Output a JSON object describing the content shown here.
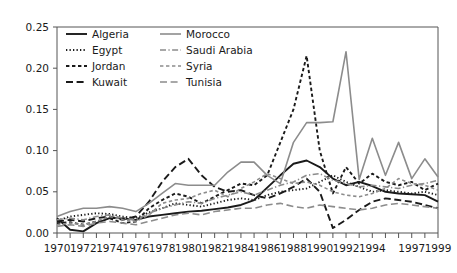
{
  "chart_data": {
    "type": "line",
    "title": "",
    "subtitle": "",
    "xlabel": "",
    "ylabel": "",
    "grid": false,
    "legend_position": "top-left-inside",
    "xlim": [
      1970,
      1999
    ],
    "ylim": [
      0.0,
      0.25
    ],
    "ytick_labels": [
      "0.00",
      "0.05",
      "0.10",
      "0.15",
      "0.20",
      "0.25"
    ],
    "ytick_values": [
      0.0,
      0.05,
      0.1,
      0.15,
      0.2,
      0.25
    ],
    "xtick_values": [
      1970,
      1971,
      1972,
      1973,
      1974,
      1975,
      1976,
      1977,
      1978,
      1979,
      1980,
      1981,
      1982,
      1983,
      1984,
      1985,
      1986,
      1987,
      1988,
      1989,
      1990,
      1991,
      1992,
      1993,
      1994,
      1995,
      1996,
      1997,
      1998,
      1999
    ],
    "xtick_labels": [
      "1970",
      "",
      "1972",
      "",
      "1974",
      "",
      "1976",
      "",
      "1978",
      "",
      "1980",
      "",
      "1982",
      "",
      "1984",
      "",
      "1986",
      "",
      "1988",
      "",
      "1990",
      "",
      "1992",
      "",
      "1994",
      "",
      "",
      "1997",
      "",
      "1999"
    ],
    "x": [
      1970,
      1971,
      1972,
      1973,
      1974,
      1975,
      1976,
      1977,
      1978,
      1979,
      1980,
      1981,
      1982,
      1983,
      1984,
      1985,
      1986,
      1987,
      1988,
      1989,
      1990,
      1991,
      1992,
      1993,
      1994,
      1995,
      1996,
      1997,
      1998,
      1999
    ],
    "series": [
      {
        "name": "Algeria",
        "color": "#1a1a1a",
        "dash": "none",
        "width": 1.9,
        "values": [
          0.018,
          0.004,
          0.002,
          0.012,
          0.018,
          0.018,
          0.016,
          0.02,
          0.022,
          0.024,
          0.026,
          0.027,
          0.029,
          0.031,
          0.034,
          0.04,
          0.055,
          0.07,
          0.084,
          0.088,
          0.08,
          0.066,
          0.058,
          0.062,
          0.057,
          0.05,
          0.048,
          0.047,
          0.046,
          0.038
        ]
      },
      {
        "name": "Egypt",
        "color": "#1a1a1a",
        "dash": "dotted",
        "width": 1.9,
        "values": [
          0.015,
          0.02,
          0.022,
          0.024,
          0.023,
          0.02,
          0.018,
          0.025,
          0.03,
          0.036,
          0.034,
          0.032,
          0.036,
          0.04,
          0.042,
          0.04,
          0.046,
          0.05,
          0.052,
          0.054,
          0.062,
          0.07,
          0.062,
          0.056,
          0.05,
          0.052,
          0.05,
          0.048,
          0.05,
          0.046
        ]
      },
      {
        "name": "Jordan",
        "color": "#1a1a1a",
        "dash": "short-dash",
        "width": 1.9,
        "values": [
          0.012,
          0.013,
          0.01,
          0.014,
          0.018,
          0.012,
          0.014,
          0.03,
          0.04,
          0.048,
          0.044,
          0.036,
          0.044,
          0.052,
          0.06,
          0.058,
          0.07,
          0.11,
          0.15,
          0.215,
          0.1,
          0.048,
          0.08,
          0.06,
          0.072,
          0.062,
          0.058,
          0.062,
          0.052,
          0.06
        ]
      },
      {
        "name": "Kuwait",
        "color": "#1a1a1a",
        "dash": "long-dash",
        "width": 1.9,
        "values": [
          0.014,
          0.016,
          0.014,
          0.018,
          0.02,
          0.016,
          0.02,
          0.038,
          0.062,
          0.08,
          0.09,
          0.07,
          0.056,
          0.05,
          0.052,
          0.046,
          0.042,
          0.048,
          0.056,
          0.066,
          0.05,
          0.006,
          0.016,
          0.028,
          0.038,
          0.042,
          0.04,
          0.038,
          0.034,
          0.03
        ]
      },
      {
        "name": "Morocco",
        "color": "#8c8c8c",
        "dash": "none",
        "width": 1.6,
        "values": [
          0.02,
          0.026,
          0.03,
          0.03,
          0.032,
          0.03,
          0.026,
          0.036,
          0.048,
          0.06,
          0.058,
          0.058,
          0.058,
          0.074,
          0.086,
          0.086,
          0.07,
          0.06,
          0.11,
          0.134,
          0.134,
          0.135,
          0.22,
          0.065,
          0.115,
          0.07,
          0.11,
          0.066,
          0.09,
          0.068
        ]
      },
      {
        "name": "Saudi Arabia",
        "color": "#8c8c8c",
        "dash": "dash-dot",
        "width": 1.6,
        "values": [
          0.016,
          0.018,
          0.016,
          0.02,
          0.022,
          0.018,
          0.016,
          0.024,
          0.03,
          0.034,
          0.038,
          0.036,
          0.042,
          0.046,
          0.05,
          0.046,
          0.052,
          0.058,
          0.062,
          0.07,
          0.072,
          0.064,
          0.06,
          0.056,
          0.058,
          0.056,
          0.054,
          0.058,
          0.06,
          0.064
        ]
      },
      {
        "name": "Syria",
        "color": "#8c8c8c",
        "dash": "short-dash",
        "width": 1.6,
        "values": [
          0.01,
          0.012,
          0.01,
          0.014,
          0.02,
          0.016,
          0.014,
          0.022,
          0.036,
          0.04,
          0.042,
          0.048,
          0.052,
          0.044,
          0.054,
          0.062,
          0.072,
          0.066,
          0.06,
          0.062,
          0.058,
          0.05,
          0.046,
          0.044,
          0.048,
          0.054,
          0.066,
          0.06,
          0.058,
          0.052
        ]
      },
      {
        "name": "Tunisia",
        "color": "#8c8c8c",
        "dash": "long-dash",
        "width": 1.6,
        "values": [
          0.008,
          0.01,
          0.008,
          0.012,
          0.014,
          0.012,
          0.01,
          0.014,
          0.018,
          0.022,
          0.024,
          0.022,
          0.026,
          0.028,
          0.03,
          0.03,
          0.034,
          0.036,
          0.032,
          0.03,
          0.034,
          0.032,
          0.03,
          0.028,
          0.03,
          0.034,
          0.036,
          0.034,
          0.032,
          0.03
        ]
      }
    ]
  }
}
